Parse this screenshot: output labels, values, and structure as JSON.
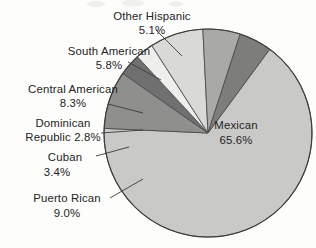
{
  "chart_data": {
    "type": "pie",
    "title": "",
    "subtitle": "",
    "xlabel": "",
    "ylabel": "",
    "legend_position": "none",
    "labels_position": "outside-with-leader-lines",
    "unit": "%",
    "categories": [
      "Mexican",
      "Puerto Rican",
      "Cuban",
      "Dominican Republic",
      "Central American",
      "South American",
      "Other Hispanic"
    ],
    "values": [
      65.6,
      9.0,
      3.4,
      2.8,
      8.3,
      5.8,
      5.1
    ],
    "value_labels": [
      "65.6%",
      "9.0%",
      "3.4%",
      "2.8%",
      "8.3%",
      "5.8%",
      "5.1%"
    ],
    "colors": [
      "#c9c9c7",
      "#8f8f8d",
      "#707070",
      "#eeeeec",
      "#d9d9d7",
      "#a9a9a7",
      "#7d7d7b"
    ],
    "slices": [
      {
        "name": "Mexican",
        "value": 65.6,
        "value_label": "65.6%",
        "color": "#c9c9c7",
        "label_placement": "inside"
      },
      {
        "name": "Puerto Rican",
        "value": 9.0,
        "value_label": "9.0%",
        "color": "#8f8f8d",
        "label_placement": "outside"
      },
      {
        "name": "Cuban",
        "value": 3.4,
        "value_label": "3.4%",
        "color": "#707070",
        "label_placement": "outside"
      },
      {
        "name": "Dominican Republic",
        "value": 2.8,
        "value_label": "2.8%",
        "color": "#eeeeec",
        "label_placement": "outside"
      },
      {
        "name": "Central American",
        "value": 8.3,
        "value_label": "8.3%",
        "color": "#d9d9d7",
        "label_placement": "outside"
      },
      {
        "name": "South American",
        "value": 5.8,
        "value_label": "5.8%",
        "color": "#a9a9a7",
        "label_placement": "outside"
      },
      {
        "name": "Other Hispanic",
        "value": 5.1,
        "value_label": "5.1%",
        "color": "#7d7d7b",
        "label_placement": "outside"
      }
    ]
  },
  "labels": {
    "other_hispanic": {
      "line1": "Other Hispanic",
      "line2": "5.1%"
    },
    "south_american": {
      "line1": "South American",
      "line2": "5.8%"
    },
    "central_american": {
      "line1": "Central American",
      "line2": "8.3%"
    },
    "dominican_republic": {
      "line1": "Dominican",
      "line2": "Republic 2.8%"
    },
    "cuban": {
      "line1": "Cuban",
      "line2": "3.4%"
    },
    "puerto_rican": {
      "line1": "Puerto Rican",
      "line2": "9.0%"
    },
    "mexican": {
      "line1": "Mexican",
      "line2": "65.6%"
    }
  }
}
